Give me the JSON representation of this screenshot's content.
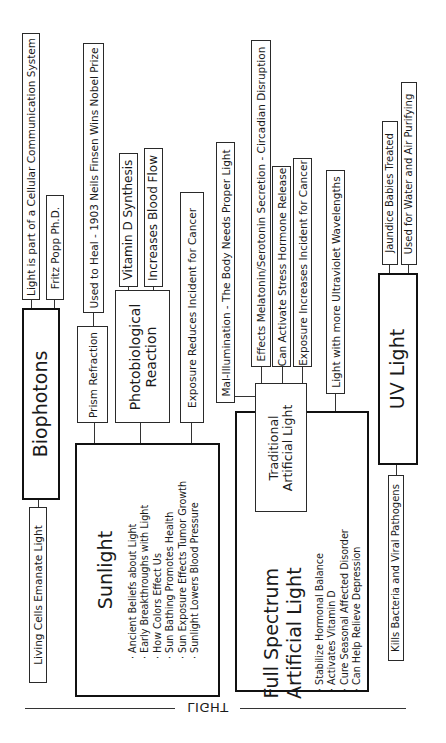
{
  "diagram": {
    "title": "LIGHT",
    "orientation": "rotated 90deg counter-clockwise",
    "nodes": {
      "biophotons": {
        "label": "Biophotons",
        "children": [
          "Light is part of a Cellular Communication System",
          "Fritz Popp Ph.D.",
          "Living Cells Emanate Light"
        ]
      },
      "sunlight": {
        "label": "Sunlight",
        "bullets": [
          "Ancient Beliefs about Light",
          "Early Breakthroughs with Light",
          "How Colors Effect Us",
          "Sun Bathing Promotes Health",
          "Sun Exposure Effects Tumor Growth",
          "Sunlight Lowers Blood Pressure"
        ],
        "children": {
          "prism": {
            "label": "Prism Refraction",
            "children": [
              "Used to Heal - 1903 Neils Finsen Wins Nobel Prize"
            ]
          },
          "photobiological": {
            "label": "Photobiological Reaction",
            "line1": "Photobiological",
            "line2": "Reaction",
            "children": [
              "Vitamin D Synthesis",
              "Increases Blood Flow"
            ]
          },
          "exposure_reduces": "Exposure Reduces Incident for Cancer"
        }
      },
      "full_spectrum": {
        "label": "Full Spectrum Artificial Light",
        "line1": "Full Spectrum",
        "line2": "Artificial Light",
        "bullets": [
          "Stabilize Hormonal Balance",
          "Activates Vitamin D",
          "Cure Seasonal Affected Disorder",
          "Can Help Relieve Depression"
        ],
        "children": {
          "traditional": {
            "label": "Traditional Artificial Light",
            "line1": "Traditional",
            "line2": "Artificial Light",
            "children": [
              "Mal-Illumination - The Body Needs Proper Light",
              "Effects Melatonin/Serotonin Secretion - Circadian Disruption",
              "Can Activate Stress Hormone Release",
              "Exposure Increases Incident for Cancer"
            ]
          },
          "more_uv": "Light with more Ultraviolet Wavelengths"
        }
      },
      "uv_light": {
        "label": "UV Light",
        "children": [
          "Jaundice Babies Treated",
          "Used for Water and Air Purifying",
          "Kills Bacteria and Viral Pathogens"
        ]
      }
    }
  }
}
